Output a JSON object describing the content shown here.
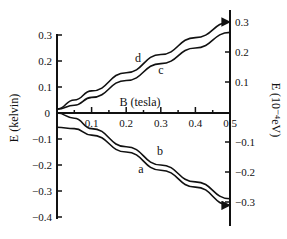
{
  "chart_data": {
    "type": "line",
    "title": "",
    "xlabel": "B (tesla)",
    "ylabel_left": "E (kelvin)",
    "ylabel_right": "E (10⁻⁴eV)",
    "xlim": [
      0,
      0.5
    ],
    "ylim_left": [
      -0.4,
      0.3
    ],
    "ylim_right": [
      -0.35,
      0.35
    ],
    "x_ticks": [
      "0.1",
      "0.2",
      "0.3",
      "0.4",
      "0.5"
    ],
    "y_ticks_left": [
      "0.3",
      "0.2",
      "0.1",
      "0",
      "−0.1",
      "−0.2",
      "−0.3",
      "−0.4"
    ],
    "y_ticks_right": [
      "0.3",
      "0.2",
      "0.1",
      "−0.1",
      "−0.2",
      "−0.3"
    ],
    "grid": false,
    "legend": "none (curves labeled inline)",
    "series": [
      {
        "name": "d",
        "x": [
          0,
          0.05,
          0.1,
          0.2,
          0.3,
          0.4,
          0.5
        ],
        "values": [
          0.015,
          0.05,
          0.085,
          0.155,
          0.225,
          0.29,
          0.35
        ],
        "arrow": true
      },
      {
        "name": "c",
        "x": [
          0,
          0.05,
          0.1,
          0.2,
          0.3,
          0.4,
          0.5
        ],
        "values": [
          0.015,
          0.03,
          0.06,
          0.125,
          0.19,
          0.25,
          0.31
        ],
        "arrow": false
      },
      {
        "name": "b",
        "x": [
          0,
          0.05,
          0.1,
          0.2,
          0.3,
          0.4,
          0.5
        ],
        "values": [
          0.0,
          -0.02,
          -0.06,
          -0.13,
          -0.2,
          -0.265,
          -0.33
        ],
        "arrow": false
      },
      {
        "name": "a",
        "x": [
          0,
          0.05,
          0.1,
          0.2,
          0.3,
          0.4,
          0.5
        ],
        "values": [
          -0.055,
          -0.06,
          -0.085,
          -0.15,
          -0.22,
          -0.285,
          -0.355
        ],
        "arrow": true
      }
    ]
  },
  "labels": {
    "xlabel": "B (tesla)",
    "ylabel_left": "E (kelvin)",
    "ylabel_right": "E (10⁻⁴eV)",
    "zero": "0",
    "curve_a": "a",
    "curve_b": "b",
    "curve_c": "c",
    "curve_d": "d"
  }
}
